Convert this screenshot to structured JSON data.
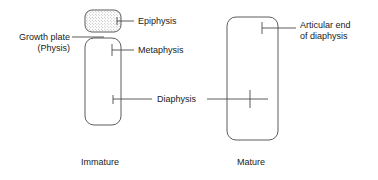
{
  "figure": {
    "type": "anatomical-diagram",
    "background_color": "#ffffff",
    "line_color": "#4a4a4a",
    "text_color": "#1a1a1a",
    "stipple_color": "#8a8a8a"
  },
  "labels": {
    "epiphysis": "Epiphysis",
    "metaphysis": "Metaphysis",
    "diaphysis": "Diaphysis",
    "growth_plate_line1": "Growth plate",
    "growth_plate_line2": "(Physis)",
    "articular_end_line1": "Articular end",
    "articular_end_line2": "of diaphysis"
  },
  "captions": {
    "immature": "Immature",
    "mature": "Mature"
  },
  "structures": {
    "immature": {
      "epiphysis": {
        "fill": "stippled",
        "shape": "rounded-rect"
      },
      "shaft": {
        "fill": "none",
        "shape": "rounded-rect"
      }
    },
    "mature": {
      "shaft": {
        "fill": "none",
        "shape": "rounded-rect"
      }
    }
  }
}
